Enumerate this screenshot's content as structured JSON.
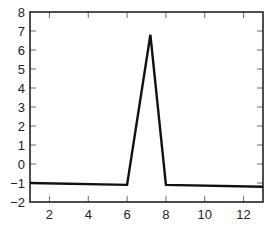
{
  "chart_data": {
    "type": "line",
    "title": "",
    "xlabel": "",
    "ylabel": "",
    "xlim": [
      1,
      13
    ],
    "ylim": [
      -2,
      8
    ],
    "xticks": [
      2,
      4,
      6,
      8,
      10,
      12
    ],
    "yticks": [
      -2,
      -1,
      0,
      1,
      2,
      3,
      4,
      5,
      6,
      7,
      8
    ],
    "grid": false,
    "legend": null,
    "series": [
      {
        "name": "signal",
        "x": [
          1,
          6,
          7.2,
          8,
          13
        ],
        "y": [
          -1.0,
          -1.1,
          6.8,
          -1.1,
          -1.2
        ]
      }
    ],
    "colors": {
      "line": "#111111",
      "axes": "#222222"
    }
  }
}
